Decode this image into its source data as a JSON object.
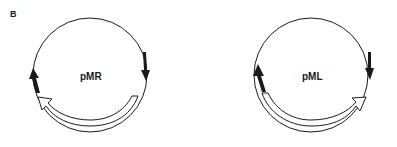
{
  "figure": {
    "panel_label": "B",
    "plasmids": [
      {
        "name": "pMR",
        "features": [
          {
            "type": "solid-arrow",
            "position": "right",
            "direction": "clockwise"
          },
          {
            "type": "solid-arrow",
            "position": "left",
            "direction": "clockwise"
          },
          {
            "type": "open-arrow",
            "position": "bottom",
            "direction": "clockwise"
          }
        ]
      },
      {
        "name": "pML",
        "features": [
          {
            "type": "solid-arrow",
            "position": "right",
            "direction": "clockwise"
          },
          {
            "type": "solid-arrow",
            "position": "left",
            "direction": "clockwise"
          },
          {
            "type": "open-arrow",
            "position": "bottom",
            "direction": "counterclockwise"
          }
        ]
      }
    ],
    "colors": {
      "stroke": "#1a1a1a",
      "background": "#ffffff"
    }
  }
}
